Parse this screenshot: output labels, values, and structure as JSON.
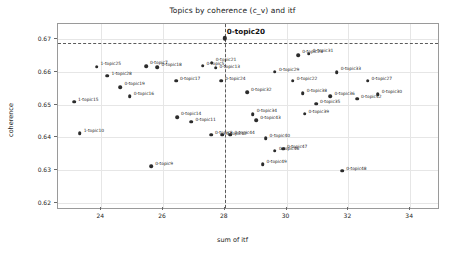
{
  "chart_data": {
    "type": "scatter",
    "title": "Topics by coherence (c_v) and itf",
    "xlabel": "sum of itf",
    "ylabel": "coherence",
    "xlim": [
      22.6,
      34.9
    ],
    "ylim": [
      0.6185,
      0.6745
    ],
    "xticks": [
      24,
      26,
      28,
      30,
      32,
      34
    ],
    "xticklabels": [
      "24",
      "26",
      "28",
      "30",
      "32",
      "34"
    ],
    "yticks": [
      0.62,
      0.63,
      0.64,
      0.65,
      0.66,
      0.67
    ],
    "yticklabels": [
      "0.62",
      "0.63",
      "0.64",
      "0.65",
      "0.66",
      "0.67"
    ],
    "grid": true,
    "legend": null,
    "reference_lines": {
      "vertical_x": 28.0,
      "horizontal_y": 0.6688
    },
    "highlight": {
      "label": "0-topic20",
      "x": 28.0,
      "y": 0.6702
    },
    "marker_color": "#2b2b2b",
    "points": [
      {
        "label": "1-topic15",
        "x": 23.12,
        "y": 0.6508,
        "lx": 4,
        "ly": -3
      },
      {
        "label": "1-topic10",
        "x": 23.3,
        "y": 0.6412,
        "lx": 4,
        "ly": -3
      },
      {
        "label": "1-topic25",
        "x": 23.85,
        "y": 0.6615,
        "lx": 4,
        "ly": -4
      },
      {
        "label": "1-topic28",
        "x": 24.2,
        "y": 0.6588,
        "lx": 4,
        "ly": -3
      },
      {
        "label": "0-topic19",
        "x": 24.62,
        "y": 0.6552,
        "lx": 4,
        "ly": -4
      },
      {
        "label": "0-topic16",
        "x": 24.92,
        "y": 0.6525,
        "lx": 4,
        "ly": -3
      },
      {
        "label": "0-topic7",
        "x": 25.45,
        "y": 0.6617,
        "lx": 4,
        "ly": -4
      },
      {
        "label": "0-topic18",
        "x": 25.82,
        "y": 0.6613,
        "lx": 4,
        "ly": -3
      },
      {
        "label": "0-topic9",
        "x": 25.62,
        "y": 0.6313,
        "lx": 4,
        "ly": -3
      },
      {
        "label": "0-topic17",
        "x": 26.42,
        "y": 0.6572,
        "lx": 4,
        "ly": -3
      },
      {
        "label": "0-topic14",
        "x": 26.45,
        "y": 0.6462,
        "lx": 4,
        "ly": -4
      },
      {
        "label": "0-topic11",
        "x": 26.92,
        "y": 0.6448,
        "lx": 4,
        "ly": -3
      },
      {
        "label": "0-topic5",
        "x": 27.28,
        "y": 0.6618,
        "lx": 4,
        "ly": -3
      },
      {
        "label": "0-topic21",
        "x": 27.58,
        "y": 0.6627,
        "lx": 4,
        "ly": -4
      },
      {
        "label": "0-topic13",
        "x": 27.7,
        "y": 0.6612,
        "lx": 4,
        "ly": -2
      },
      {
        "label": "0-topic24",
        "x": 27.88,
        "y": 0.6572,
        "lx": 4,
        "ly": -3
      },
      {
        "label": "0-topic8",
        "x": 27.55,
        "y": 0.6408,
        "lx": 4,
        "ly": -3
      },
      {
        "label": "0-topic12",
        "x": 27.92,
        "y": 0.6408,
        "lx": 4,
        "ly": -2
      },
      {
        "label": "0-topic44",
        "x": 28.18,
        "y": 0.6408,
        "lx": 4,
        "ly": -3
      },
      {
        "label": "0-topic32",
        "x": 28.72,
        "y": 0.6538,
        "lx": 4,
        "ly": -3
      },
      {
        "label": "0-topic34",
        "x": 28.9,
        "y": 0.647,
        "lx": 4,
        "ly": -4
      },
      {
        "label": "0-topic43",
        "x": 29.02,
        "y": 0.6452,
        "lx": 4,
        "ly": -3
      },
      {
        "label": "0-topic40",
        "x": 29.32,
        "y": 0.6398,
        "lx": 4,
        "ly": -3
      },
      {
        "label": "0-topic49",
        "x": 29.22,
        "y": 0.6318,
        "lx": 4,
        "ly": -3
      },
      {
        "label": "0-topic46",
        "x": 29.62,
        "y": 0.636,
        "lx": 4,
        "ly": -3
      },
      {
        "label": "0-topic47",
        "x": 29.88,
        "y": 0.6365,
        "lx": 4,
        "ly": -3
      },
      {
        "label": "0-topic29",
        "x": 29.62,
        "y": 0.66,
        "lx": 4,
        "ly": -3
      },
      {
        "label": "0-topic22",
        "x": 30.2,
        "y": 0.6572,
        "lx": 4,
        "ly": -3
      },
      {
        "label": "0-topic23",
        "x": 30.38,
        "y": 0.665,
        "lx": 4,
        "ly": -4
      },
      {
        "label": "0-topic31",
        "x": 30.72,
        "y": 0.6655,
        "lx": 4,
        "ly": -4
      },
      {
        "label": "0-topic38",
        "x": 30.52,
        "y": 0.6535,
        "lx": 4,
        "ly": -3
      },
      {
        "label": "0-topic39",
        "x": 30.58,
        "y": 0.6472,
        "lx": 4,
        "ly": -3
      },
      {
        "label": "0-topic35",
        "x": 30.95,
        "y": 0.6502,
        "lx": 4,
        "ly": -3
      },
      {
        "label": "0-topic33",
        "x": 31.62,
        "y": 0.6598,
        "lx": 4,
        "ly": -4
      },
      {
        "label": "0-topic36",
        "x": 31.42,
        "y": 0.6525,
        "lx": 4,
        "ly": -3
      },
      {
        "label": "0-topic48",
        "x": 31.8,
        "y": 0.6298,
        "lx": 4,
        "ly": -3
      },
      {
        "label": "0-topic42",
        "x": 32.28,
        "y": 0.6518,
        "lx": 4,
        "ly": -3
      },
      {
        "label": "0-topic27",
        "x": 32.62,
        "y": 0.6572,
        "lx": 4,
        "ly": -3
      },
      {
        "label": "0-topic30",
        "x": 32.95,
        "y": 0.6532,
        "lx": 4,
        "ly": -3
      }
    ]
  }
}
